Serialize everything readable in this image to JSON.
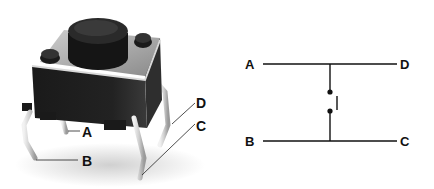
{
  "photo": {
    "subject": "tactile push-button switch",
    "labels": {
      "a": "A",
      "b": "B",
      "c": "C",
      "d": "D"
    }
  },
  "schematic": {
    "labels": {
      "a": "A",
      "b": "B",
      "c": "C",
      "d": "D"
    },
    "element": "normally-open push-button switch"
  },
  "colors": {
    "ink": "#111111",
    "body": "#1c1c1c",
    "leg": "#d8d8d8"
  }
}
